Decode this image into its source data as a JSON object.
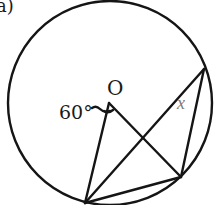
{
  "figure": {
    "part_label": "a)",
    "center_label": "O",
    "angle_label": "60°",
    "unknown_label": "x",
    "colors": {
      "stroke": "#151515",
      "text": "#1a1a1a",
      "unknown": "#7a7a7a",
      "background": "#ffffff"
    }
  },
  "geometry": {
    "circle": {
      "cx": 110,
      "cy": 103,
      "r": 102
    },
    "points": {
      "O": [
        109,
        103
      ],
      "A": [
        85,
        203
      ],
      "B": [
        181,
        177
      ],
      "C": [
        204,
        69
      ]
    },
    "segments": [
      [
        "O",
        "A"
      ],
      [
        "O",
        "B"
      ],
      [
        "A",
        "B"
      ],
      [
        "A",
        "C"
      ],
      [
        "B",
        "C"
      ]
    ]
  }
}
